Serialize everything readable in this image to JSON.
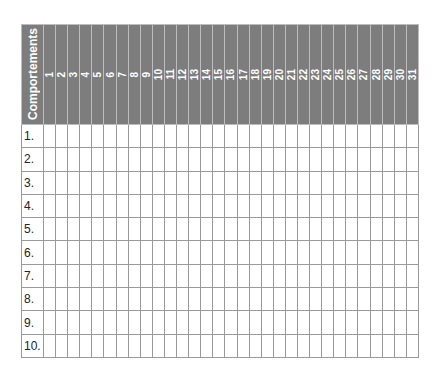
{
  "header": {
    "title": "Comportements",
    "days": [
      "1",
      "2",
      "3",
      "4",
      "5",
      "6",
      "7",
      "8",
      "9",
      "10",
      "11",
      "12",
      "13",
      "14",
      "15",
      "16",
      "17",
      "18",
      "19",
      "20",
      "21",
      "22",
      "23",
      "24",
      "25",
      "26",
      "27",
      "28",
      "29",
      "30",
      "31"
    ]
  },
  "rows": [
    "1.",
    "2.",
    "3.",
    "4.",
    "5.",
    "6.",
    "7.",
    "8.",
    "9.",
    "10."
  ],
  "colors": {
    "header_bg": "#7d7d7d",
    "header_text": "#ffffff",
    "grid": "#9a9a9a"
  }
}
